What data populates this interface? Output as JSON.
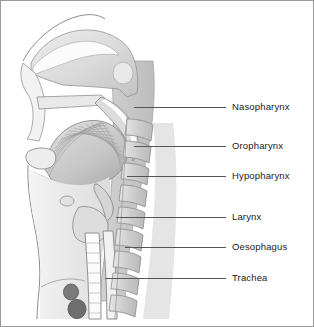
{
  "figure": {
    "border_color": "#9a9a9a",
    "background_color": "#ffffff"
  },
  "palette": {
    "tissue_light": "#e4e4e4",
    "tissue_mid": "#cfcfcf",
    "tissue_dark": "#b4b4b4",
    "bone": "#d6d6d6",
    "outline": "#8c8c8c",
    "vessel_dark": "#6f6f6f",
    "leader_line": "#555555",
    "label_text": "#222222"
  },
  "labels": [
    {
      "id": "nasopharynx",
      "text": "Nasopharynx",
      "text_x": 231,
      "text_y": 101,
      "leader_x": 133,
      "leader_y": 106,
      "leader_width": 92
    },
    {
      "id": "oropharynx",
      "text": "Oropharynx",
      "text_x": 231,
      "text_y": 140,
      "leader_x": 133,
      "leader_y": 145,
      "leader_width": 92
    },
    {
      "id": "hypopharynx",
      "text": "Hypopharynx",
      "text_x": 231,
      "text_y": 170,
      "leader_x": 126,
      "leader_y": 175,
      "leader_width": 99
    },
    {
      "id": "larynx",
      "text": "Larynx",
      "text_x": 231,
      "text_y": 211,
      "leader_x": 115,
      "leader_y": 216,
      "leader_width": 110
    },
    {
      "id": "oesophagus",
      "text": "Oesophagus",
      "text_x": 231,
      "text_y": 241,
      "leader_x": 124,
      "leader_y": 246,
      "leader_width": 101
    },
    {
      "id": "trachea",
      "text": "Trachea",
      "text_x": 231,
      "text_y": 272,
      "leader_x": 104,
      "leader_y": 277,
      "leader_width": 121
    }
  ],
  "structures": [
    {
      "id": "cranial-base-outline",
      "name": "Cranial base outline"
    },
    {
      "id": "nasal-cavity",
      "name": "Nasal cavity"
    },
    {
      "id": "sphenoid-sinus",
      "name": "Sphenoid sinus"
    },
    {
      "id": "hard-palate",
      "name": "Hard palate"
    },
    {
      "id": "soft-palate",
      "name": "Soft palate"
    },
    {
      "id": "tongue",
      "name": "Tongue with muscle striations"
    },
    {
      "id": "mandible",
      "name": "Mandible"
    },
    {
      "id": "epiglottis",
      "name": "Epiglottis"
    },
    {
      "id": "hyoid-bone",
      "name": "Hyoid bone"
    },
    {
      "id": "laryngeal-cartilage",
      "name": "Laryngeal cartilage"
    },
    {
      "id": "trachea-tube",
      "name": "Trachea"
    },
    {
      "id": "oesophagus-tube",
      "name": "Oesophagus"
    },
    {
      "id": "cervical-vertebrae",
      "name": "Cervical vertebral column"
    },
    {
      "id": "great-vessels",
      "name": "Great vessels cross-section"
    },
    {
      "id": "neck-skin-outline",
      "name": "Anterior neck skin outline"
    }
  ]
}
